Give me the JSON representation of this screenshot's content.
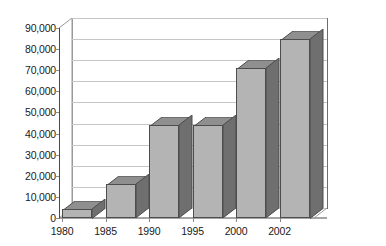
{
  "chart_data": {
    "type": "bar",
    "title": "",
    "subtitle": "",
    "xlabel": "",
    "ylabel": "",
    "categories": [
      "1980",
      "1985",
      "1990",
      "1995",
      "2000",
      "2002"
    ],
    "values": [
      4500,
      16000,
      44000,
      44000,
      71000,
      85000
    ],
    "series": [
      {
        "name": "",
        "values": [
          4500,
          16000,
          44000,
          44000,
          71000,
          85000
        ]
      }
    ],
    "ylim": [
      0,
      90000
    ],
    "ytick_values": [
      0,
      10000,
      20000,
      30000,
      40000,
      50000,
      60000,
      70000,
      80000,
      90000
    ],
    "ytick_labels": [
      "0",
      "10,000",
      "20,000",
      "30,000",
      "40,000",
      "50,000",
      "60,000",
      "70,000",
      "80,000",
      "90,000"
    ],
    "xtick_labels": [
      "1980",
      "1985",
      "1990",
      "1995",
      "2000",
      "2002"
    ],
    "grid": true,
    "grid_axis": "y",
    "legend": false,
    "legend_position": "none",
    "style": "3d-column",
    "annotations": [],
    "colors": {
      "bar_front": "#b4b4b4",
      "bar_side": "#6f6f6f",
      "bar_top": "#8f8f8f",
      "bar_outline": "#4d4d4d",
      "gridline": "#c6c6c6",
      "axis": "#4a4a4a",
      "plot_background": "#ffffff",
      "text": "#1a1a1a"
    }
  }
}
